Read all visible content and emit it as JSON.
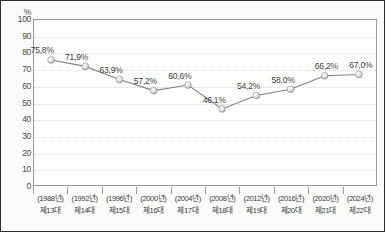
{
  "chart_data": {
    "type": "line",
    "title": "",
    "subtitle": "",
    "xlabel": "",
    "ylabel": "%",
    "unit_label": "%",
    "ylim": [
      0,
      100
    ],
    "yticks": [
      100,
      90,
      80,
      70,
      60,
      50,
      40,
      30,
      20,
      10,
      0
    ],
    "grid": true,
    "legend": "none",
    "categories": [
      "(1988년)\n제13대",
      "(1992년)\n제14대",
      "(1996년)\n제15대",
      "(2000년)\n제16대",
      "(2004년)\n제17대",
      "(2008년)\n제18대",
      "(2012년)\n제19대",
      "(2016년)\n제20대",
      "(2020년)\n제21대",
      "(2024년)\n제22대"
    ],
    "category_years": [
      "(1988년)",
      "(1992년)",
      "(1996년)",
      "(2000년)",
      "(2004년)",
      "(2008년)",
      "(2012년)",
      "(2016년)",
      "(2020년)",
      "(2024년)"
    ],
    "category_terms": [
      "제13대",
      "제14대",
      "제15대",
      "제16대",
      "제17대",
      "제18대",
      "제19대",
      "제20대",
      "제21대",
      "제22대"
    ],
    "values": [
      75.8,
      71.9,
      63.9,
      57.2,
      60.6,
      46.1,
      54.2,
      58.0,
      66.2,
      67.0
    ],
    "value_labels": [
      "75,8%",
      "71,9%",
      "63,9%",
      "57,2%",
      "60,6%",
      "46.1%",
      "54,2%",
      "58.0%",
      "66,2%",
      "67,0%"
    ],
    "colors": {
      "line": "#808080",
      "marker_fill": "#ededed",
      "marker_edge": "#8c8c8c",
      "gridline": "#dcdcdc",
      "plot_border": "#9a9a9a",
      "text": "#3b3b3b",
      "background": "#fbfbfb",
      "plot_background": "#ffffff",
      "frame_border": "#2e2e2e"
    }
  }
}
